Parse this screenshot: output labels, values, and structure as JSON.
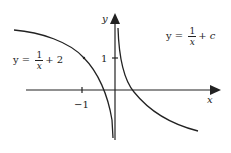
{
  "diagram": {
    "axes": {
      "x_label": "x",
      "y_label": "y",
      "tick_x": "−1",
      "tick_y": "1"
    },
    "curve_left": {
      "prefix": "y = ",
      "num": "1",
      "den": "x",
      "suffix": "+ 2"
    },
    "curve_right": {
      "prefix": "y = ",
      "num": "1",
      "den": "x",
      "suffix": "+ c"
    },
    "colors": {
      "ink": "#222222",
      "background": "#ffffff"
    }
  }
}
